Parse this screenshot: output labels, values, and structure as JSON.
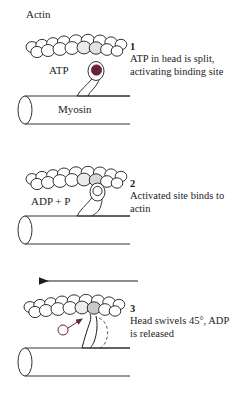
{
  "figure": {
    "title_label": "Actin",
    "background_color": "#ffffff",
    "ink_color": "#1d1d1d",
    "accent_color": "#6b2040"
  },
  "labels": {
    "actin": "Actin",
    "atp": "ATP",
    "myosin": "Myosin",
    "adp_p": "ADP + P"
  },
  "steps": [
    {
      "number": "1",
      "text": "ATP in head is split, activating binding site",
      "head_state": "filled",
      "head_color": "#6b2040"
    },
    {
      "number": "2",
      "text": "Activated site binds to actin",
      "head_state": "open",
      "head_color": "#1d1d1d"
    },
    {
      "number": "3",
      "text": "Head swivels 45°, ADP is released",
      "head_state": "swiveled",
      "head_color": "#6b2040"
    }
  ],
  "annotations": {
    "movement_arrow_direction": "left",
    "dashed_outline_meaning": "previous head position"
  }
}
